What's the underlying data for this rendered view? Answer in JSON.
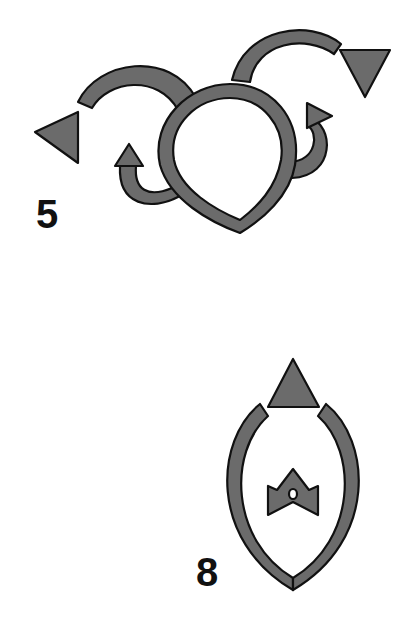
{
  "colors": {
    "fill": "#6b6b6b",
    "stroke": "#111111",
    "background": "#ffffff"
  },
  "figures": [
    {
      "id": "figure-5",
      "label": "5",
      "description": "Teardrop-shaped loop with two outward curving arcs ending in triangular arrowheads (left and upper-right) and two small hooked arrows curling upward on either side"
    },
    {
      "id": "figure-8",
      "label": "8",
      "description": "Almond-shaped ring open at the top with a triangle arrowhead in the gap, and a small crown/bow-tie shaped glyph in the center"
    }
  ]
}
